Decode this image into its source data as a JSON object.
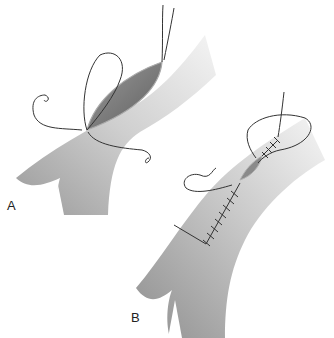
{
  "figure": {
    "panels": [
      {
        "id": "A",
        "label": "A",
        "description": "Vessel with open longitudinal incision and two suture needles placed at the ends"
      },
      {
        "id": "B",
        "label": "B",
        "description": "Vessel with incision partially closed by running suture"
      }
    ]
  },
  "colors": {
    "background": "#ffffff",
    "vessel_dark": "#8c8c8c",
    "vessel_light": "#f2f2f2",
    "incision": "#7a7a7a",
    "suture": "#333333"
  }
}
